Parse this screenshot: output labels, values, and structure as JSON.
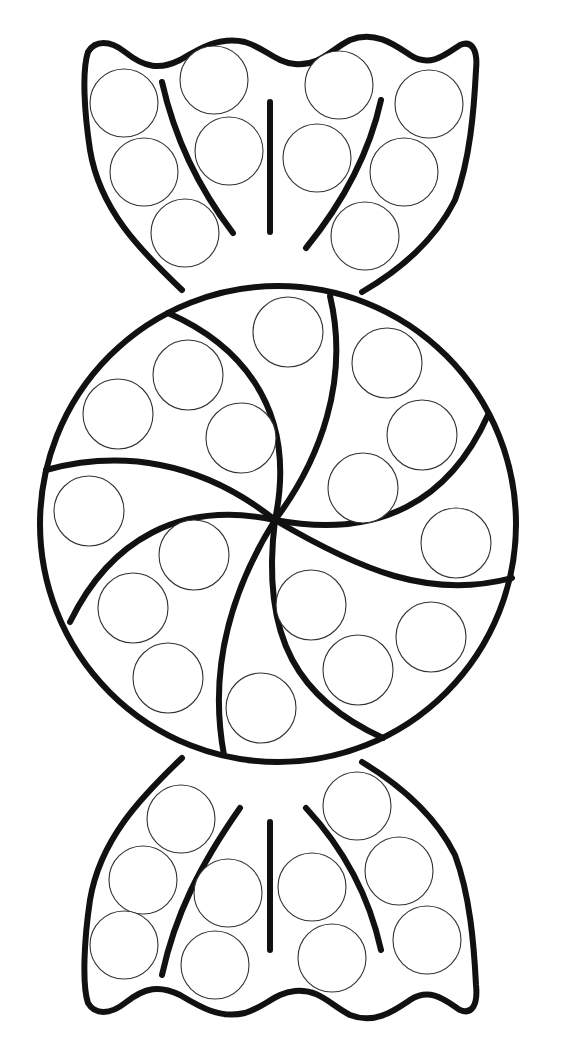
{
  "page": {
    "background": "#ffffff",
    "line_color": "#111111"
  },
  "figure": {
    "parts": [
      "top-wrapper",
      "peppermint-swirl",
      "bottom-wrapper"
    ],
    "dot_counts": {
      "top_wrapper": 11,
      "peppermint": 21,
      "bottom_wrapper": 11
    }
  }
}
